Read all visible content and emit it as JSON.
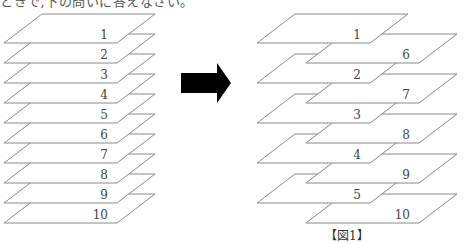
{
  "header": {
    "text": "ときで,下の問いに答えなさい。"
  },
  "figure": {
    "caption": "【図1】",
    "colors": {
      "stroke": "#8a8a8a",
      "fill": "#ffffff",
      "arrow": "#000000",
      "label": "#444444"
    },
    "plate_shape": {
      "width": 113,
      "height": 29,
      "skew": 38
    },
    "left_stack": {
      "description": "10 plates stacked in order 1-10",
      "plates": [
        {
          "label": "1",
          "x": 4,
          "y_bottom": 43
        },
        {
          "label": "2",
          "x": 4,
          "y_bottom": 63
        },
        {
          "label": "3",
          "x": 4,
          "y_bottom": 83
        },
        {
          "label": "4",
          "x": 4,
          "y_bottom": 103
        },
        {
          "label": "5",
          "x": 4,
          "y_bottom": 123
        },
        {
          "label": "6",
          "x": 4,
          "y_bottom": 143
        },
        {
          "label": "7",
          "x": 4,
          "y_bottom": 163
        },
        {
          "label": "8",
          "x": 4,
          "y_bottom": 183
        },
        {
          "label": "9",
          "x": 4,
          "y_bottom": 203
        },
        {
          "label": "10",
          "x": 4,
          "y_bottom": 223
        }
      ]
    },
    "arrow": {
      "direction": "right",
      "shaft": [
        181,
        73,
        217,
        93
      ],
      "head": [
        217,
        63,
        231,
        83,
        217,
        103
      ]
    },
    "right_stack": {
      "description": "plates interleaved: 1,6,2,7,3,8,4,9,5,10",
      "plates": [
        {
          "label": "1",
          "x": 257,
          "y_bottom": 43
        },
        {
          "label": "6",
          "x": 306,
          "y_bottom": 63
        },
        {
          "label": "2",
          "x": 257,
          "y_bottom": 83
        },
        {
          "label": "7",
          "x": 306,
          "y_bottom": 103
        },
        {
          "label": "3",
          "x": 257,
          "y_bottom": 123
        },
        {
          "label": "8",
          "x": 306,
          "y_bottom": 143
        },
        {
          "label": "4",
          "x": 257,
          "y_bottom": 163
        },
        {
          "label": "9",
          "x": 306,
          "y_bottom": 183
        },
        {
          "label": "5",
          "x": 257,
          "y_bottom": 203
        },
        {
          "label": "10",
          "x": 306,
          "y_bottom": 223
        }
      ]
    }
  }
}
